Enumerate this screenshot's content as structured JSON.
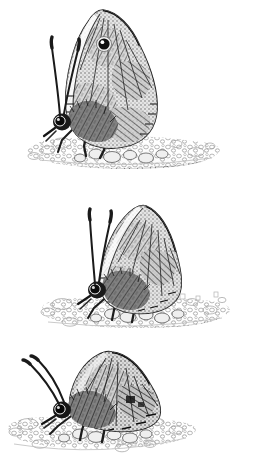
{
  "plate": {
    "title": "Butterfly pen-and-ink illustration plate",
    "medium": "pen-and-ink stipple / cross-hatch drawing",
    "background_color": "#ffffff",
    "ink_color": "#1a1a1a",
    "midtone_color": "#6e6e6e",
    "light_tone_color": "#b8b8b8",
    "width_px": 255,
    "height_px": 471,
    "figure_count": 3,
    "subject": "satyrine butterfly perched on gravel",
    "caption": "",
    "visible_text": ""
  },
  "figures": [
    {
      "id": "figure-1",
      "name": "butterfly-upper",
      "label": "",
      "pose": "wings closed upright, head left, facing left",
      "body_color": "#2b2b2b",
      "wing_base_color": "#8a8a8a",
      "wing_pattern": "mottled cryptic cross-hatch with pale bands",
      "eyespot": {
        "present": true,
        "ring_color": "#111111",
        "pupil_color": "#ffffff",
        "center_x": 104,
        "center_y": 44,
        "radius": 7
      },
      "antennae_count": 2,
      "leg_count": 3,
      "substrate": "pebble gravel bed with cast shadow",
      "substrate_y": 150
    },
    {
      "id": "figure-2",
      "name": "butterfly-middle",
      "label": "",
      "pose": "wings closed upright, head left, antennae raised",
      "body_color": "#2b2b2b",
      "wing_base_color": "#8a8a8a",
      "wing_pattern": "mottled cryptic cross-hatch, radiating hindwing striae",
      "eyespot": {
        "present": false,
        "ring_color": "#111111",
        "pupil_color": "#ffffff",
        "center_x": 0,
        "center_y": 0,
        "radius": 0
      },
      "antennae_count": 2,
      "leg_count": 3,
      "substrate": "pebble gravel bed with cast shadow",
      "substrate_y": 118
    },
    {
      "id": "figure-3",
      "name": "butterfly-lower",
      "label": "",
      "pose": "wings closed, body low and tilted, head left",
      "body_color": "#2b2b2b",
      "wing_base_color": "#8a8a8a",
      "wing_pattern": "dense mottled cross-hatch, darker overall",
      "eyespot": {
        "present": false,
        "ring_color": "#111111",
        "pupil_color": "#ffffff",
        "center_x": 0,
        "center_y": 0,
        "radius": 0
      },
      "antennae_count": 2,
      "leg_count": 3,
      "substrate": "pebble gravel bed with cast shadow",
      "substrate_y": 78
    }
  ]
}
